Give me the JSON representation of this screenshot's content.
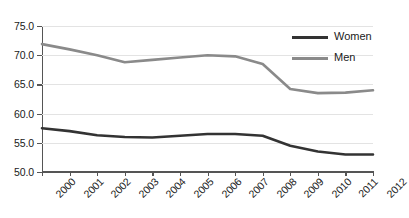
{
  "chart_data": {
    "type": "line",
    "title": "",
    "xlabel": "",
    "ylabel": "",
    "categories": [
      "2000",
      "2001",
      "2002",
      "2003",
      "2004",
      "2005",
      "2006",
      "2007",
      "2008",
      "2009",
      "2010",
      "2011",
      "2012"
    ],
    "x": [
      2000,
      2001,
      2002,
      2003,
      2004,
      2005,
      2006,
      2007,
      2008,
      2009,
      2010,
      2011,
      2012
    ],
    "series": [
      {
        "name": "Women",
        "color": "#333333",
        "values": [
          57.5,
          57.0,
          56.3,
          56.0,
          55.9,
          56.2,
          56.5,
          56.5,
          56.2,
          54.5,
          53.5,
          53.0,
          53.0
        ]
      },
      {
        "name": "Men",
        "color": "#8a8a8a",
        "values": [
          71.9,
          71.0,
          70.0,
          68.8,
          69.2,
          69.6,
          70.0,
          69.8,
          68.5,
          64.2,
          63.5,
          63.6,
          64.0
        ]
      }
    ],
    "ylim": [
      50.0,
      75.0
    ],
    "ytick_step": 5.0,
    "ytick_labels": [
      "75.0",
      "70.0",
      "65.0",
      "60.0",
      "55.0",
      "50.0"
    ],
    "ytick_values": [
      75.0,
      70.0,
      65.0,
      60.0,
      55.0,
      50.0
    ],
    "grid": true,
    "grid_axis": "y",
    "legend_position": "top-right",
    "legend": [
      "Women",
      "Men"
    ]
  },
  "legend": {
    "entries": [
      {
        "label": "Women",
        "color": "#333333"
      },
      {
        "label": "Men",
        "color": "#8a8a8a"
      }
    ]
  }
}
